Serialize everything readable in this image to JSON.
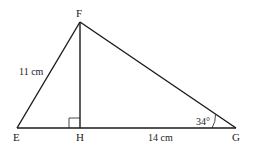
{
  "diagram": {
    "type": "triangle",
    "vertices": {
      "E": {
        "label": "E",
        "x": 17,
        "y": 128
      },
      "F": {
        "label": "F",
        "x": 80,
        "y": 22
      },
      "G": {
        "label": "G",
        "x": 236,
        "y": 128
      },
      "H": {
        "label": "H",
        "x": 80,
        "y": 128
      }
    },
    "labels": {
      "EF_length": "11 cm",
      "HG_length": "14 cm",
      "angle_G": "34°"
    },
    "right_angle_at": "H",
    "colors": {
      "stroke": "#1a1a1a",
      "text": "#222222"
    }
  }
}
